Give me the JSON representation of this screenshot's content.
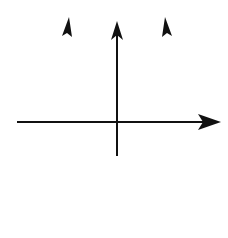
{
  "chart_data": {
    "type": "area",
    "title": "",
    "equation": "y ≥ x² − 2",
    "inequality": {
      "lhs": "y",
      "op": "≥",
      "rhs_base": "x",
      "rhs_exp": "2",
      "rhs_rest": " − 2"
    },
    "xlabel": "x",
    "ylabel": "y",
    "origin_label": "0",
    "tick_labels": {
      "x": [
        "2"
      ],
      "y": [
        "−2"
      ]
    },
    "xlim": [
      -6,
      6
    ],
    "ylim": [
      -5.5,
      6.3
    ],
    "grid": true,
    "grid_style": "dotted",
    "boundary": {
      "function": "x^2 - 2",
      "style": "solid",
      "vertex": [
        0,
        -2
      ],
      "x_intercepts": [
        -1.414,
        1.414
      ]
    },
    "shaded_region": "inside parabola (y >= x^2 - 2)",
    "sample_points": [
      {
        "x": -2.8,
        "y": 5.84
      },
      {
        "x": -2,
        "y": 2
      },
      {
        "x": -1,
        "y": -1
      },
      {
        "x": 0,
        "y": -2
      },
      {
        "x": 1,
        "y": -1
      },
      {
        "x": 2,
        "y": 2
      },
      {
        "x": 2.8,
        "y": 5.84
      }
    ]
  },
  "colors": {
    "shade": "#a8a8a8",
    "curve": "#111111",
    "grid": "#555555",
    "axis": "#111111"
  }
}
